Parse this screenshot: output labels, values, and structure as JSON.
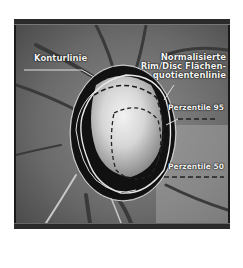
{
  "figure": {
    "labels": {
      "contour": "Konturlinie",
      "rim_disc_line1": "Normalisierte",
      "rim_disc_line2": "Rim/Disc Flächen-",
      "rim_disc_line3": "quotientenlinie",
      "percentile95": "Perzentile 95",
      "percentile50": "Perzentile 50"
    },
    "colors": {
      "frame": "#1a1a1a",
      "label_text": "#f4f4f4",
      "contour_line": "#d8d8d8",
      "rim_area": "#101010"
    }
  }
}
